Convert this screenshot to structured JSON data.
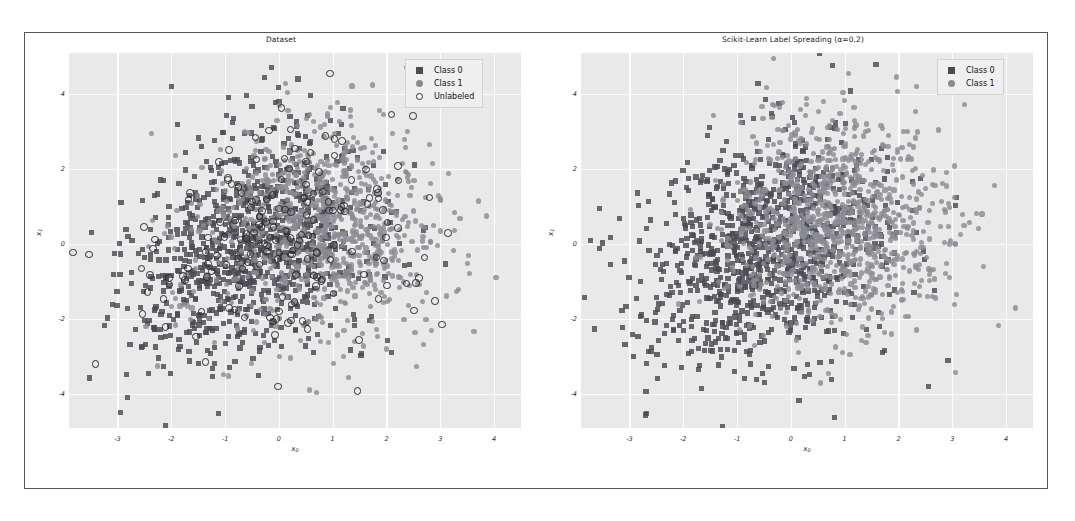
{
  "figure": {
    "background": "#ffffff",
    "frame_color": "#555555",
    "axes_background": "#e9e9e9",
    "grid_color": "#fdfdfd"
  },
  "chart_data": [
    {
      "type": "scatter",
      "panel": "left",
      "title": "Dataset",
      "xlabel": "x₀",
      "ylabel": "x₁",
      "xlim": [
        -3.9,
        4.5
      ],
      "ylim": [
        -4.9,
        5.1
      ],
      "xticks": [
        "-3",
        "-2",
        "-1",
        "0",
        "1",
        "2",
        "3",
        "4"
      ],
      "xtick_values": [
        -3,
        -2,
        -1,
        0,
        1,
        2,
        3,
        4
      ],
      "yticks": [
        "4",
        "2",
        "0",
        "-2",
        "-4"
      ],
      "ytick_values": [
        4,
        2,
        0,
        -2,
        -4
      ],
      "grid": true,
      "legend_position": "upper right",
      "series": [
        {
          "name": "Class 0",
          "marker": "square",
          "color": "#4b4b52",
          "approx_count": 900,
          "center": [
            -0.5,
            0.2
          ],
          "spread": [
            1.1,
            1.5
          ]
        },
        {
          "name": "Class 1",
          "marker": "circle",
          "color": "#8b8b92",
          "approx_count": 900,
          "center": [
            0.7,
            0.6
          ],
          "spread": [
            1.1,
            1.4
          ]
        },
        {
          "name": "Unlabeled",
          "marker": "open-circle",
          "color": "#2b2b2b",
          "approx_count": 180,
          "center": [
            0.1,
            0.4
          ],
          "spread": [
            1.4,
            1.6
          ]
        }
      ]
    },
    {
      "type": "scatter",
      "panel": "right",
      "title": "Scikit-Learn Label Spreading (α=0.2)",
      "xlabel": "x₀",
      "ylabel": "x₁",
      "xlim": [
        -3.9,
        4.5
      ],
      "ylim": [
        -4.9,
        5.1
      ],
      "xticks": [
        "-3",
        "-2",
        "-1",
        "0",
        "1",
        "2",
        "3",
        "4"
      ],
      "xtick_values": [
        -3,
        -2,
        -1,
        0,
        1,
        2,
        3,
        4
      ],
      "yticks": [
        "4",
        "2",
        "0",
        "-2",
        "-4"
      ],
      "ytick_values": [
        4,
        2,
        0,
        -2,
        -4
      ],
      "grid": true,
      "legend_position": "upper right",
      "series": [
        {
          "name": "Class 0",
          "marker": "square",
          "color": "#4b4b52",
          "approx_count": 1000,
          "center": [
            -0.5,
            0.1
          ],
          "spread": [
            1.1,
            1.5
          ]
        },
        {
          "name": "Class 1",
          "marker": "circle",
          "color": "#8b8b92",
          "approx_count": 980,
          "center": [
            0.8,
            0.6
          ],
          "spread": [
            1.0,
            1.4
          ]
        }
      ]
    }
  ],
  "panels": {
    "left": {
      "title": "Dataset",
      "xlabel_main": "x",
      "xlabel_sub": "0",
      "ylabel_main": "x",
      "ylabel_sub": "1",
      "legend": [
        {
          "label": "Class 0",
          "marker": "square-marker-icon"
        },
        {
          "label": "Class 1",
          "marker": "circle-marker-icon"
        },
        {
          "label": "Unlabeled",
          "marker": "open-circle-marker-icon"
        }
      ]
    },
    "right": {
      "title": "Scikit-Learn Label Spreading (α=0.2)",
      "xlabel_main": "x",
      "xlabel_sub": "0",
      "ylabel_main": "x",
      "ylabel_sub": "1",
      "legend": [
        {
          "label": "Class 0",
          "marker": "square-marker-icon"
        },
        {
          "label": "Class 1",
          "marker": "circle-marker-icon"
        }
      ]
    }
  }
}
